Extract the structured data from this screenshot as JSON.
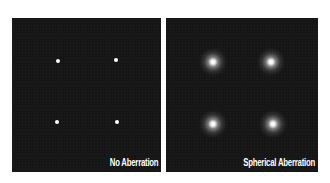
{
  "panels": [
    {
      "label": "No Aberration",
      "points": [
        {
          "x": 46,
          "y": 43
        },
        {
          "x": 104,
          "y": 42
        },
        {
          "x": 45,
          "y": 104
        },
        {
          "x": 105,
          "y": 104
        }
      ]
    },
    {
      "label": "Spherical Aberration",
      "points": [
        {
          "x": 47,
          "y": 44
        },
        {
          "x": 105,
          "y": 44
        },
        {
          "x": 47,
          "y": 106
        },
        {
          "x": 107,
          "y": 106
        }
      ]
    }
  ],
  "colors": {
    "background": "#ffffff",
    "panel": "#161616",
    "point": "#ffffff",
    "label": "#ffffff"
  }
}
